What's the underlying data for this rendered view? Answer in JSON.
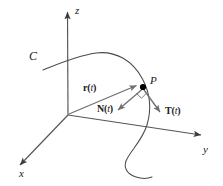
{
  "figure": {
    "background_color": "#ffffff",
    "line_color": "#4d4d4d",
    "vector_color": "#666666",
    "text_color": "#1a1a1a",
    "point_color": "#000000"
  },
  "axes": {
    "z": {
      "label": "z",
      "name": "z-axis",
      "direction": "up"
    },
    "y": {
      "label": "y",
      "name": "y-axis",
      "direction": "lower-right"
    },
    "x": {
      "label": "x",
      "name": "x-axis",
      "direction": "lower-left"
    }
  },
  "curve": {
    "label": "C",
    "name": "space-curve"
  },
  "point": {
    "label": "P",
    "name": "point-on-curve"
  },
  "vectors": [
    {
      "name": "position-vector",
      "symbol": "r",
      "arg": "(",
      "param": "t",
      "argclose": ")",
      "label": "r(t)",
      "from": "origin",
      "to": "P"
    },
    {
      "name": "unit-normal-vector",
      "symbol": "N",
      "arg": "(",
      "param": "t",
      "argclose": ")",
      "label": "N(t)",
      "from": "P",
      "to": "lower-left"
    },
    {
      "name": "unit-tangent-vector",
      "symbol": "T",
      "arg": "(",
      "param": "t",
      "argclose": ")",
      "label": "T(t)",
      "from": "P",
      "to": "lower-right"
    }
  ],
  "annotations": {
    "right_angle": "right-angle-marker at P between T(t) and N(t)"
  }
}
